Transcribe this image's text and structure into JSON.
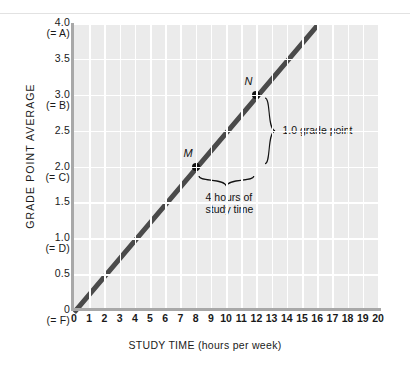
{
  "chart_data": {
    "type": "line",
    "title": "",
    "xlabel": "STUDY TIME (hours per week)",
    "ylabel": "GRADE POINT AVERAGE",
    "xlim": [
      0,
      20
    ],
    "ylim": [
      0,
      4.0
    ],
    "grid": true,
    "legend": "none",
    "x_ticks": [
      "0",
      "1",
      "2",
      "3",
      "4",
      "5",
      "6",
      "7",
      "8",
      "9",
      "10",
      "11",
      "12",
      "13",
      "14",
      "15",
      "16",
      "17",
      "18",
      "19",
      "20"
    ],
    "y_ticks": [
      {
        "value": "4.0",
        "grade": "(= A)"
      },
      {
        "value": "3.5",
        "grade": ""
      },
      {
        "value": "3.0",
        "grade": "(= B)"
      },
      {
        "value": "2.5",
        "grade": ""
      },
      {
        "value": "2.0",
        "grade": "(= C)"
      },
      {
        "value": "1.5",
        "grade": ""
      },
      {
        "value": "1.0",
        "grade": "(= D)"
      },
      {
        "value": "0.5",
        "grade": ""
      },
      {
        "value": "0",
        "grade": "(= F)"
      }
    ],
    "series": [
      {
        "name": "GPA vs study time",
        "x": [
          0,
          16
        ],
        "y": [
          0,
          4.0
        ],
        "color": "#4a4a4a"
      }
    ],
    "points": [
      {
        "label": "M",
        "x": 8,
        "y": 2.0
      },
      {
        "label": "N",
        "x": 12,
        "y": 3.0
      }
    ],
    "annotations": [
      {
        "name": "rise-label",
        "text": "1.0 grade point"
      },
      {
        "name": "run-label-line1",
        "text": "4 hours of"
      },
      {
        "name": "run-label-line2",
        "text": "study time"
      }
    ],
    "colors": {
      "plot_background": "#ebebeb",
      "gridline": "#ffffff",
      "axis": "#a8a8a8",
      "series": "#4a4a4a",
      "marker": "#111111",
      "dashed_guide": "#7a7a7a",
      "page_background": "#ffffff",
      "divider": "#e2e2e2"
    }
  }
}
